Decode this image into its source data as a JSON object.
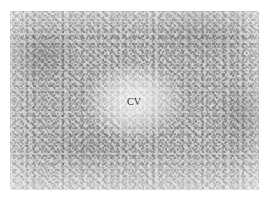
{
  "figure": {
    "kind": "histology-micrograph",
    "modality": "light-microscopy",
    "staining_appearance": "grayscale",
    "canvas": {
      "width_px": 268,
      "height_px": 200,
      "background_color": "#ffffff"
    },
    "plate": {
      "left_px": 10,
      "top_px": 11,
      "width_px": 249,
      "height_px": 179,
      "base_tone": "#d2d2d2",
      "border": "none"
    },
    "annotations": [
      {
        "id": "cv",
        "text": "CV",
        "meaning": "central vein",
        "x_px": 127,
        "y_px": 96,
        "color": "#1d1d1d",
        "font_size_px": 10
      }
    ]
  }
}
